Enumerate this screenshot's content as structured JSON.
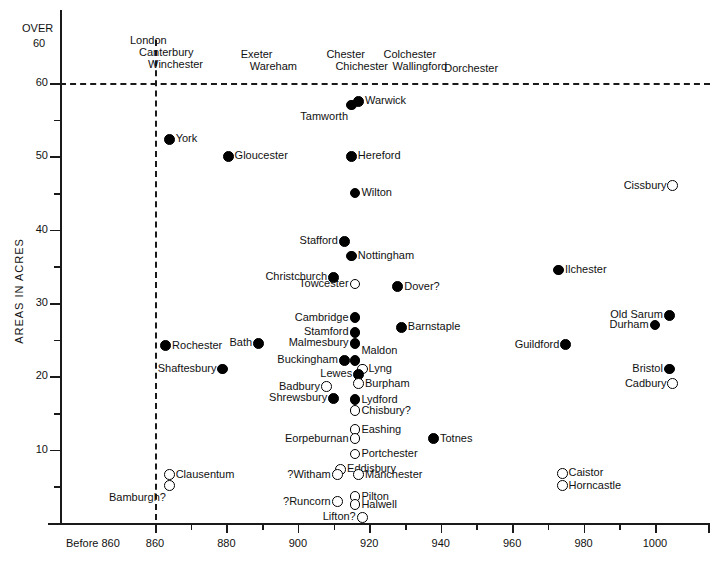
{
  "chart_data": {
    "type": "scatter",
    "title": "",
    "xlabel": "",
    "ylabel": "AREAS IN ACRES",
    "xlim": [
      850,
      1008
    ],
    "ylim": [
      0,
      64
    ],
    "grid": false,
    "legend": "none",
    "x_ticks": [
      {
        "value": 850,
        "label": "Before 860"
      },
      {
        "value": 860,
        "label": "860"
      },
      {
        "value": 880,
        "label": "880"
      },
      {
        "value": 900,
        "label": "900"
      },
      {
        "value": 920,
        "label": "920"
      },
      {
        "value": 940,
        "label": "940"
      },
      {
        "value": 960,
        "label": "960"
      },
      {
        "value": 980,
        "label": "980"
      },
      {
        "value": 1000,
        "label": "1000"
      }
    ],
    "x_minor_ticks": [
      870,
      890,
      910,
      930,
      950,
      970,
      990
    ],
    "y_ticks": [
      {
        "value": 60,
        "label": "60"
      },
      {
        "value": 50,
        "label": "50"
      },
      {
        "value": 40,
        "label": "40"
      },
      {
        "value": 30,
        "label": "30"
      },
      {
        "value": 20,
        "label": "20"
      },
      {
        "value": 10,
        "label": "10"
      }
    ],
    "y_minor_ticks": [
      55,
      45,
      35,
      25,
      15,
      5
    ],
    "over_axis_label": "OVER",
    "over_axis_value": "60",
    "threshold_line": {
      "value": 60,
      "style": "dashed"
    },
    "vertical_divider": {
      "value": 860,
      "style": "dashed"
    },
    "series": [
      {
        "name": "filled",
        "marker": "filled-circle",
        "description": "solid dot"
      },
      {
        "name": "open",
        "marker": "open-circle",
        "description": "hollow circle"
      }
    ],
    "over_60_groups": [
      {
        "labels": [
          "London",
          "Canterbury",
          "Winchester"
        ],
        "x": 853
      },
      {
        "labels": [
          "Exeter",
          "Wareham"
        ],
        "x": 884
      },
      {
        "labels": [
          "Chester",
          "Chichester"
        ],
        "x": 908
      },
      {
        "labels": [
          "Colchester",
          "Wallingford"
        ],
        "x": 924
      },
      {
        "labels": [
          "Dorchester"
        ],
        "x": 941
      }
    ],
    "points": [
      {
        "label": "Warwick",
        "x": 917,
        "y": 57.5,
        "marker": "filled",
        "label_pos": "right"
      },
      {
        "label": "Tamworth",
        "x": 915,
        "y": 57,
        "marker": "filled",
        "label_pos": "belowleft"
      },
      {
        "label": "York",
        "x": 864,
        "y": 52.3,
        "marker": "filled",
        "label_pos": "right"
      },
      {
        "label": "Gloucester",
        "x": 880.5,
        "y": 50,
        "marker": "filled",
        "label_pos": "right"
      },
      {
        "label": "Hereford",
        "x": 915,
        "y": 50,
        "marker": "filled",
        "label_pos": "right"
      },
      {
        "label": "Wilton",
        "x": 916,
        "y": 45,
        "marker": "filled",
        "label_pos": "right"
      },
      {
        "label": "Cissbury",
        "x": 1005,
        "y": 46,
        "marker": "open",
        "label_pos": "left"
      },
      {
        "label": "Stafford",
        "x": 913,
        "y": 38.4,
        "marker": "filled",
        "label_pos": "left"
      },
      {
        "label": "Nottingham",
        "x": 915,
        "y": 36.4,
        "marker": "filled",
        "label_pos": "right"
      },
      {
        "label": "Ilchester",
        "x": 973,
        "y": 34.5,
        "marker": "filled",
        "label_pos": "right"
      },
      {
        "label": "Christchurch",
        "x": 910,
        "y": 33.5,
        "marker": "filled",
        "label_pos": "left"
      },
      {
        "label": "Towcester",
        "x": 916,
        "y": 32.6,
        "marker": "open",
        "label_pos": "left"
      },
      {
        "label": "Dover?",
        "x": 928,
        "y": 32.2,
        "marker": "filled",
        "label_pos": "right"
      },
      {
        "label": "Old Sarum",
        "x": 1004,
        "y": 28.3,
        "marker": "filled",
        "label_pos": "left"
      },
      {
        "label": "Cambridge",
        "x": 916,
        "y": 28,
        "marker": "filled",
        "label_pos": "left"
      },
      {
        "label": "Stamford",
        "x": 916,
        "y": 26,
        "marker": "filled",
        "label_pos": "left"
      },
      {
        "label": "Durham",
        "x": 1000,
        "y": 27,
        "marker": "filled",
        "label_pos": "left"
      },
      {
        "label": "Barnstaple",
        "x": 929,
        "y": 26.7,
        "marker": "filled",
        "label_pos": "right"
      },
      {
        "label": "Malmesbury",
        "x": 916,
        "y": 24.5,
        "marker": "filled",
        "label_pos": "left"
      },
      {
        "label": "Bath",
        "x": 889,
        "y": 24.5,
        "marker": "filled",
        "label_pos": "left"
      },
      {
        "label": "Rochester",
        "x": 863,
        "y": 24.2,
        "marker": "filled",
        "label_pos": "right"
      },
      {
        "label": "Guildford",
        "x": 975,
        "y": 24.3,
        "marker": "filled",
        "label_pos": "left"
      },
      {
        "label": "Maldon",
        "x": 916,
        "y": 22.2,
        "marker": "filled",
        "label_pos": "aboveright"
      },
      {
        "label": "Buckingham",
        "x": 913,
        "y": 22.2,
        "marker": "filled",
        "label_pos": "left"
      },
      {
        "label": "Lyng",
        "x": 918,
        "y": 21,
        "marker": "open",
        "label_pos": "right"
      },
      {
        "label": "Shaftesbury",
        "x": 879,
        "y": 21,
        "marker": "filled",
        "label_pos": "left"
      },
      {
        "label": "Bristol",
        "x": 1004,
        "y": 21,
        "marker": "filled",
        "label_pos": "left"
      },
      {
        "label": "Lewes",
        "x": 917,
        "y": 20.3,
        "marker": "filled",
        "label_pos": "left"
      },
      {
        "label": "Burpham",
        "x": 917,
        "y": 19,
        "marker": "open",
        "label_pos": "right"
      },
      {
        "label": "Cadbury",
        "x": 1005,
        "y": 19,
        "marker": "open",
        "label_pos": "left"
      },
      {
        "label": "Badbury",
        "x": 908,
        "y": 18.6,
        "marker": "open",
        "label_pos": "left"
      },
      {
        "label": "Shrewsbury",
        "x": 910,
        "y": 17,
        "marker": "filled",
        "label_pos": "left"
      },
      {
        "label": "Lydford",
        "x": 916,
        "y": 16.8,
        "marker": "filled",
        "label_pos": "right"
      },
      {
        "label": "Chisbury?",
        "x": 916,
        "y": 15.3,
        "marker": "open",
        "label_pos": "right"
      },
      {
        "label": "Eashing",
        "x": 916,
        "y": 12.7,
        "marker": "open",
        "label_pos": "right"
      },
      {
        "label": "Eorpeburnan",
        "x": 916,
        "y": 11.5,
        "marker": "open",
        "label_pos": "left"
      },
      {
        "label": "Totnes",
        "x": 938,
        "y": 11.5,
        "marker": "filled",
        "label_pos": "right"
      },
      {
        "label": "Portchester",
        "x": 916,
        "y": 9.4,
        "marker": "open",
        "label_pos": "right"
      },
      {
        "label": "Eddisbury",
        "x": 912,
        "y": 7.3,
        "marker": "open",
        "label_pos": "right"
      },
      {
        "label": "?Witham",
        "x": 911,
        "y": 6.6,
        "marker": "open",
        "label_pos": "left"
      },
      {
        "label": "Manchester",
        "x": 917,
        "y": 6.6,
        "marker": "open",
        "label_pos": "right"
      },
      {
        "label": "Clausentum",
        "x": 864,
        "y": 6.6,
        "marker": "open",
        "label_pos": "right"
      },
      {
        "label": "Bamburgh?",
        "x": 864,
        "y": 5.1,
        "marker": "open",
        "label_pos": "belowleft"
      },
      {
        "label": "Caistor",
        "x": 974,
        "y": 6.8,
        "marker": "open",
        "label_pos": "right"
      },
      {
        "label": "Horncastle",
        "x": 974,
        "y": 5.1,
        "marker": "open",
        "label_pos": "right"
      },
      {
        "label": "Pilton",
        "x": 916,
        "y": 3.6,
        "marker": "open",
        "label_pos": "right"
      },
      {
        "label": "Halwell",
        "x": 916,
        "y": 2.5,
        "marker": "open",
        "label_pos": "right"
      },
      {
        "label": "?Runcorn",
        "x": 911,
        "y": 2.9,
        "marker": "open",
        "label_pos": "left"
      },
      {
        "label": "Lifton?",
        "x": 918,
        "y": 0.8,
        "marker": "open",
        "label_pos": "left"
      }
    ]
  }
}
